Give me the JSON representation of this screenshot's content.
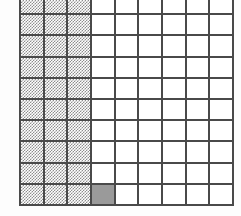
{
  "figure": {
    "kind": "shaded-grid-fraction-diagram",
    "background_color": "#fdfdfd",
    "gridline_color": "#4a4a4a",
    "shaded_dither_color": "#8e8e8e",
    "shaded_solid_color": "#9a9a9a",
    "unshaded_color": "#ffffff"
  },
  "chart_data": {
    "type": "heatmap",
    "title": "",
    "subtitle": "",
    "xlabel": "",
    "ylabel": "",
    "columns": 9,
    "rows": 10,
    "legend": [],
    "annotations": [],
    "grid": true,
    "column_labels": [
      "1",
      "2",
      "3",
      "4",
      "5",
      "6",
      "7",
      "8",
      "9"
    ],
    "row_labels": [
      "1",
      "2",
      "3",
      "4",
      "5",
      "6",
      "7",
      "8",
      "9",
      "10"
    ],
    "states": {
      "0": "unshaded",
      "1": "shaded-dither",
      "2": "shaded-solid"
    },
    "total_cells": 90,
    "shaded_cells": 31,
    "unshaded_cells": 59,
    "cells": [
      [
        1,
        1,
        1,
        0,
        0,
        0,
        0,
        0,
        0
      ],
      [
        1,
        1,
        1,
        0,
        0,
        0,
        0,
        0,
        0
      ],
      [
        1,
        1,
        1,
        0,
        0,
        0,
        0,
        0,
        0
      ],
      [
        1,
        1,
        1,
        0,
        0,
        0,
        0,
        0,
        0
      ],
      [
        1,
        1,
        1,
        0,
        0,
        0,
        0,
        0,
        0
      ],
      [
        1,
        1,
        1,
        0,
        0,
        0,
        0,
        0,
        0
      ],
      [
        1,
        1,
        1,
        0,
        0,
        0,
        0,
        0,
        0
      ],
      [
        1,
        1,
        1,
        0,
        0,
        0,
        0,
        0,
        0
      ],
      [
        1,
        1,
        1,
        0,
        0,
        0,
        0,
        0,
        0
      ],
      [
        1,
        1,
        1,
        2,
        0,
        0,
        0,
        0,
        0
      ]
    ]
  }
}
